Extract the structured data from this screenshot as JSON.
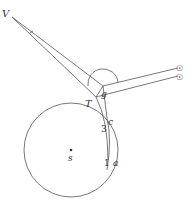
{
  "diagram": {
    "type": "geometric-astronomical-diagram",
    "labels": {
      "V": "V",
      "g": "g",
      "T": "T",
      "c": "c",
      "three": "3",
      "s": "s",
      "one": "1",
      "a": "a"
    },
    "symbols": {
      "sun_upper": "☉",
      "sun_lower": "☉"
    },
    "colors": {
      "line": "#555555",
      "text": "#333333",
      "background": "#ffffff"
    }
  }
}
